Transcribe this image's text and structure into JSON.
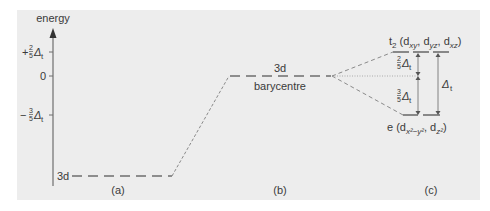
{
  "axis": {
    "label": "energy",
    "ticks": [
      {
        "label_sign": "+",
        "num": "2",
        "den": "5",
        "sym": "Δ",
        "sub": "t"
      },
      {
        "label": "0"
      },
      {
        "label_sign": "−",
        "num": "3",
        "den": "5",
        "sym": "Δ",
        "sub": "t"
      }
    ]
  },
  "panels": {
    "a": {
      "level_label": "3d",
      "caption": "(a)"
    },
    "b": {
      "level_label": "3d",
      "sublabel": "barycentre",
      "caption": "(b)"
    },
    "c": {
      "t2_label": "t",
      "t2_sub": "2",
      "t2_orbitals": "(d",
      "t2_o1": "xy",
      "t2_o2": "yz",
      "t2_o3": "xz",
      "e_label": "e (d",
      "e_o1": "x²−y²",
      "e_o2": "z²",
      "upper_num": "2",
      "upper_den": "5",
      "lower_num": "3",
      "lower_den": "5",
      "delta": "Δ",
      "delta_sub": "t",
      "caption": "(c)"
    }
  },
  "colors": {
    "panel_bg": "#ededed",
    "line": "#6e6e6e",
    "dashed": "#8a8a8a",
    "text": "#3a3a3a"
  }
}
